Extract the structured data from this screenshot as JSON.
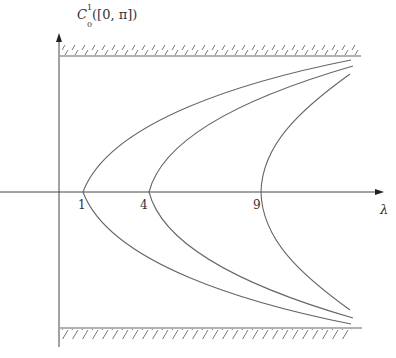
{
  "labels": {
    "y_axis": "C",
    "y_axis_sub": "0",
    "y_axis_sup": "1",
    "y_axis_args": "([0, π])",
    "x_axis": "λ",
    "tick_1": "1",
    "tick_4": "4",
    "tick_9": "9"
  },
  "colors": {
    "line": "#555555",
    "curve": "#666666"
  },
  "curves": [
    {
      "vertex_lambda": 1
    },
    {
      "vertex_lambda": 4
    },
    {
      "vertex_lambda": 9
    }
  ]
}
